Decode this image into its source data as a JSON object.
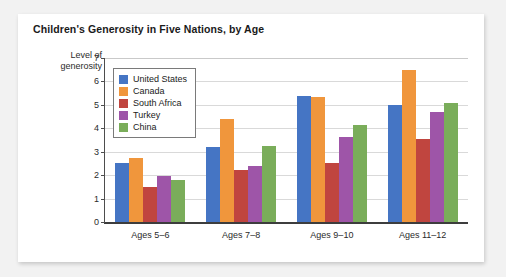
{
  "figure": {
    "title": "Children's Generosity in Five Nations, by Age"
  },
  "chart_data": {
    "type": "bar",
    "title": "Children's Generosity in Five Nations, by Age",
    "xlabel": "",
    "ylabel": "Level of generosity",
    "ylim": [
      0,
      7
    ],
    "yticks": [
      0,
      1,
      2,
      3,
      4,
      5,
      6,
      7
    ],
    "grid": true,
    "legend_position": "upper-left-inside",
    "categories": [
      "Ages 5–6",
      "Ages 7–8",
      "Ages 9–10",
      "Ages 11–12"
    ],
    "series": [
      {
        "name": "United States",
        "color": "#4575c4",
        "values": [
          2.5,
          3.2,
          5.4,
          5.0
        ]
      },
      {
        "name": "Canada",
        "color": "#f0963c",
        "values": [
          2.75,
          4.4,
          5.35,
          6.5
        ]
      },
      {
        "name": "South Africa",
        "color": "#c0453f",
        "values": [
          1.5,
          2.2,
          2.5,
          3.55
        ]
      },
      {
        "name": "Turkey",
        "color": "#9e55a8",
        "values": [
          1.95,
          2.4,
          3.65,
          4.7
        ]
      },
      {
        "name": "China",
        "color": "#7aad5a",
        "values": [
          1.8,
          3.25,
          4.15,
          5.1
        ]
      }
    ]
  },
  "axis": {
    "y_caption_line1": "Level of",
    "y_caption_line2": "generosity"
  }
}
